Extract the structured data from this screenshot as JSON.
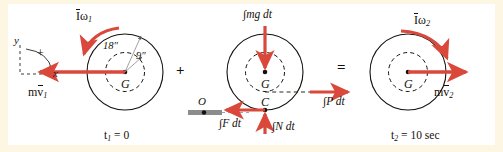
{
  "figure": {
    "type": "impulse-momentum-diagram",
    "background_color": "#fdf6e3",
    "panel_color": "#ffffff",
    "vector_color": "#d9483b",
    "outline_color": "#15110c",
    "ground_color": "#8c8c8c"
  },
  "axes_key": {
    "y_label": "y",
    "x_label": "x",
    "positive_label": "+"
  },
  "panel1": {
    "outer_radius_label": "18″",
    "inner_radius_label": "9″",
    "center_label": "G",
    "angular_momentum_label_I": "I",
    "angular_momentum_label_w": "ω",
    "angular_momentum_sub": "1",
    "linear_momentum_m": "m",
    "linear_momentum_v": "v",
    "linear_momentum_sub": "1",
    "time_label": "t",
    "time_sub": "1",
    "time_value": "= 0"
  },
  "operator_plus": "+",
  "operator_equals": "=",
  "panel2": {
    "center_label": "G",
    "contact_label": "C",
    "origin_label": "O",
    "impulse_weight": "∫mg dt",
    "impulse_friction": "∫F dt",
    "impulse_normal": "∫N dt",
    "impulse_applied": "∫P dt"
  },
  "panel3": {
    "center_label": "G",
    "angular_momentum_label_I": "I",
    "angular_momentum_label_w": "ω",
    "angular_momentum_sub": "2",
    "linear_momentum_m": "m",
    "linear_momentum_v": "v",
    "linear_momentum_sub": "2",
    "time_label": "t",
    "time_sub": "2",
    "time_value": "= 10 sec"
  }
}
